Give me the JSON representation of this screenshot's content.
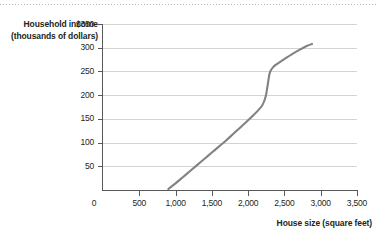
{
  "chart_data": {
    "type": "line",
    "title": "",
    "xlabel": "House size (square feet)",
    "ylabel": "Household income (thousands of dollars)",
    "xlim": [
      0,
      3500
    ],
    "ylim": [
      0,
      350
    ],
    "grid": true,
    "legend": false,
    "x_ticks": [
      0,
      500,
      1000,
      1500,
      2000,
      2500,
      3000,
      3500
    ],
    "x_tick_labels": [
      "0",
      "500",
      "1,000",
      "1,500",
      "2,000",
      "2,500",
      "3,000",
      "3,500"
    ],
    "y_ticks": [
      0,
      50,
      100,
      150,
      200,
      250,
      300,
      350
    ],
    "y_tick_labels": [
      "0",
      "50",
      "100",
      "150",
      "200",
      "250",
      "300",
      "$350"
    ],
    "series": [
      {
        "name": "Household income vs. house size",
        "color": "#808285",
        "x": [
          900,
          1000,
          1100,
          1200,
          1300,
          1400,
          1500,
          1600,
          1700,
          1800,
          1900,
          2000,
          2075,
          2150,
          2200,
          2240,
          2270,
          2300,
          2350,
          2420,
          2500,
          2600,
          2700,
          2800,
          2880
        ],
        "y": [
          2,
          14,
          27,
          40,
          53,
          66,
          79,
          92,
          105,
          119,
          133,
          147,
          158,
          170,
          180,
          196,
          222,
          248,
          260,
          268,
          276,
          286,
          295,
          303,
          308
        ]
      }
    ]
  },
  "axis": {
    "y_title_line1": "Household income",
    "y_title_line2": "(thousands of dollars)",
    "x_title": "House size (square feet)"
  }
}
